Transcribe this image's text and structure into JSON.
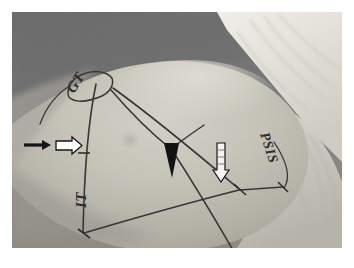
{
  "figure": {
    "kind": "clinical-photograph",
    "border_color": "#ffffff",
    "background_color": "#6f6f6f",
    "skin_color": "#b9b6ad",
    "drape_color": "#e8e6df",
    "marking_color": "#2b2b2b",
    "annotation_color": "#111111"
  },
  "photo": {
    "width": 330,
    "height": 236,
    "regions": [
      {
        "name": "background-wall",
        "tone": "#6e6e6e"
      },
      {
        "name": "skin-buttock",
        "tone": "#bab7ae"
      },
      {
        "name": "surgical-drape",
        "tone": "#e9e7e0"
      },
      {
        "name": "lower-shadow",
        "tone": "#8f8c85"
      }
    ]
  },
  "labels": {
    "gt": "GT",
    "it": "IT",
    "psis": "PSIS"
  },
  "markers": {
    "solid_arrow": "solid-arrow",
    "open_arrow": "open-arrow",
    "triangle_pointer": "solid-triangle-pointer",
    "open_vertical_arrow": "open-vertical-arrow"
  },
  "skin_markings": {
    "description": "ink lines connecting bony landmarks",
    "vertices": [
      {
        "name": "gt-apex",
        "x": 100,
        "y": 80
      },
      {
        "name": "left-vertical-mid",
        "x": 67,
        "y": 145
      },
      {
        "name": "it-vertex",
        "x": 72,
        "y": 222
      },
      {
        "name": "mid-junction",
        "x": 160,
        "y": 137
      },
      {
        "name": "psis-junction",
        "x": 228,
        "y": 178
      },
      {
        "name": "lateral-marker",
        "x": 270,
        "y": 175
      },
      {
        "name": "inferior-vertex",
        "x": 226,
        "y": 246
      }
    ]
  }
}
